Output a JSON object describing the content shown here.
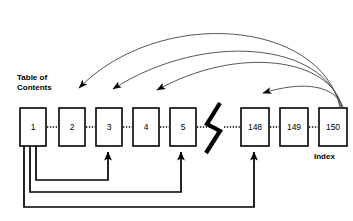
{
  "diagram": {
    "type": "book-navigation-diagram",
    "labels": {
      "toc_line1": "Table of",
      "toc_line2": "Contents",
      "index": "Index"
    },
    "colors": {
      "stroke": "#000000",
      "arc_stroke": "#444444",
      "background": "#ffffff"
    },
    "pages": [
      {
        "id": "page-1",
        "label": "1",
        "x": 20,
        "y": 108,
        "w": 26,
        "h": 38
      },
      {
        "id": "page-2",
        "label": "2",
        "x": 59,
        "y": 108,
        "w": 26,
        "h": 38
      },
      {
        "id": "page-3",
        "label": "3",
        "x": 96,
        "y": 108,
        "w": 26,
        "h": 38
      },
      {
        "id": "page-4",
        "label": "4",
        "x": 133,
        "y": 108,
        "w": 26,
        "h": 38
      },
      {
        "id": "page-5",
        "label": "5",
        "x": 170,
        "y": 108,
        "w": 26,
        "h": 38
      },
      {
        "id": "page-148",
        "label": "148",
        "x": 241,
        "y": 108,
        "w": 28,
        "h": 38
      },
      {
        "id": "page-149",
        "label": "149",
        "x": 280,
        "y": 108,
        "w": 28,
        "h": 38
      },
      {
        "id": "page-150",
        "label": "150",
        "x": 319,
        "y": 108,
        "w": 28,
        "h": 38
      }
    ],
    "connectors": {
      "dotted_links": [
        {
          "from": "page-1",
          "to": "page-2",
          "x1": 46,
          "x2": 59,
          "y": 127
        },
        {
          "from": "page-2",
          "to": "page-3",
          "x1": 85,
          "x2": 96,
          "y": 127
        },
        {
          "from": "page-3",
          "to": "page-4",
          "x1": 122,
          "x2": 133,
          "y": 127
        },
        {
          "from": "page-4",
          "to": "page-5",
          "x1": 159,
          "x2": 170,
          "y": 127
        },
        {
          "from": "page-5",
          "to": "break",
          "x1": 196,
          "x2": 214,
          "y": 127
        },
        {
          "from": "break",
          "to": "page-148",
          "x1": 224,
          "x2": 241,
          "y": 127
        },
        {
          "from": "page-148",
          "to": "page-149",
          "x1": 269,
          "x2": 280,
          "y": 127
        },
        {
          "from": "page-149",
          "to": "page-150",
          "x1": 308,
          "x2": 319,
          "y": 127
        }
      ],
      "index_arcs": [
        {
          "from": "page-150",
          "to": "page-2",
          "note": "index entry to page 2"
        },
        {
          "from": "page-150",
          "to": "page-3",
          "note": "index entry to page 3"
        },
        {
          "from": "page-150",
          "to": "page-5",
          "note": "index entry to page 5"
        },
        {
          "from": "page-150",
          "to": "page-148",
          "note": "index entry to page 148"
        }
      ],
      "toc_returns": [
        {
          "from": "page-1",
          "to": "page-3",
          "note": "contents entry to page 3"
        },
        {
          "from": "page-1",
          "to": "page-5",
          "note": "contents entry to page 5"
        },
        {
          "from": "page-1",
          "to": "page-148",
          "note": "contents entry to page 148"
        }
      ]
    }
  }
}
